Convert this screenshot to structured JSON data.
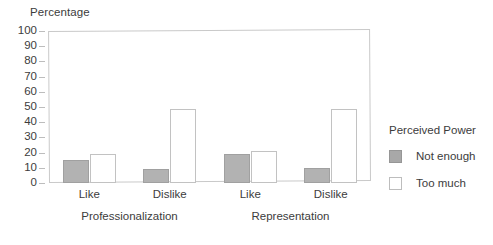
{
  "chart_data": {
    "type": "bar",
    "title": "",
    "ylabel": "Percentage",
    "xlabel": "",
    "ylim": [
      0,
      100
    ],
    "yticks": [
      0,
      10,
      20,
      30,
      40,
      50,
      60,
      70,
      80,
      90,
      100
    ],
    "grid": false,
    "legend_position": "right",
    "legend_title": "Perceived Power",
    "groups": [
      {
        "name": "Professionalization",
        "categories": [
          "Like",
          "Dislike"
        ]
      },
      {
        "name": "Representation",
        "categories": [
          "Like",
          "Dislike"
        ]
      }
    ],
    "categories": [
      "Professionalization - Like",
      "Professionalization - Dislike",
      "Representation - Like",
      "Representation - Dislike"
    ],
    "series": [
      {
        "name": "Not enough",
        "color": "#b2b2b2",
        "values": [
          15,
          9,
          19,
          10
        ]
      },
      {
        "name": "Too much",
        "color": "#ffffff",
        "values": [
          19,
          49,
          21,
          49
        ]
      }
    ]
  },
  "axis": {
    "title": "Percentage",
    "ticks": [
      "100",
      "90",
      "80",
      "70",
      "60",
      "50",
      "40",
      "30",
      "20",
      "10",
      "0"
    ]
  },
  "category_labels": [
    {
      "label": "Like"
    },
    {
      "label": "Dislike"
    },
    {
      "label": "Like"
    },
    {
      "label": "Dislike"
    }
  ],
  "group_labels": [
    {
      "label": "Professionalization"
    },
    {
      "label": "Representation"
    }
  ],
  "legend": {
    "title": "Perceived Power",
    "items": [
      {
        "label": "Not enough",
        "swatch": "gray-filled-swatch"
      },
      {
        "label": "Too much",
        "swatch": "white-outline-swatch"
      }
    ]
  }
}
